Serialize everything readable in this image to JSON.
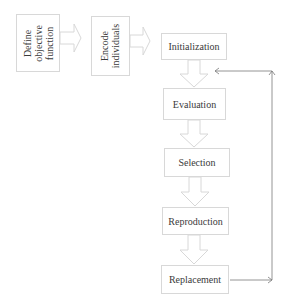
{
  "diagram": {
    "left_steps": [
      {
        "label_lines": [
          "Define",
          "objective",
          "function"
        ]
      },
      {
        "label_lines": [
          "Encode",
          "individuals"
        ]
      }
    ],
    "main_steps": [
      {
        "label": "Initialization"
      },
      {
        "label": "Evaluation"
      },
      {
        "label": "Selection"
      },
      {
        "label": "Reproduction"
      },
      {
        "label": "Replacement"
      }
    ],
    "feedback_loop": {
      "from": "Replacement",
      "to": "Initialization"
    },
    "colors": {
      "box_border": "#d8d8d8",
      "block_arrow": "#d8d8d8",
      "line_arrow": "#7a7a7a",
      "text": "#3a3a3a"
    }
  }
}
